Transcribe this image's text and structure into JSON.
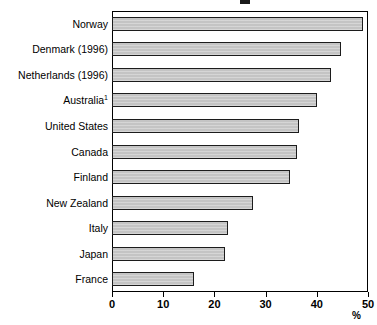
{
  "chart_data": {
    "type": "bar",
    "orientation": "horizontal",
    "title": "",
    "xlabel": "%",
    "ylabel": "",
    "xlim": [
      0,
      50
    ],
    "xticks": [
      0,
      10,
      20,
      30,
      40,
      50
    ],
    "xtick_labels": [
      "0",
      "10",
      "20",
      "30",
      "40",
      "50"
    ],
    "grid": false,
    "legend": null,
    "categories": [
      "Norway",
      "Denmark (1996)",
      "Netherlands (1996)",
      "Australia",
      "United States",
      "Canada",
      "Finland",
      "New Zealand",
      "Italy",
      "Japan",
      "France"
    ],
    "category_footnotes": [
      "",
      "",
      "",
      "1",
      "",
      "",
      "",
      "",
      "",
      "",
      ""
    ],
    "values": [
      49.0,
      44.8,
      42.8,
      40.0,
      36.5,
      36.1,
      34.8,
      27.5,
      22.6,
      22.0,
      16.0
    ],
    "bar_fill_color": "#c4c4c4",
    "bar_border_color": "#1c1c1c",
    "axis_color": "#000000"
  },
  "axis": {
    "unit_label": "%"
  }
}
